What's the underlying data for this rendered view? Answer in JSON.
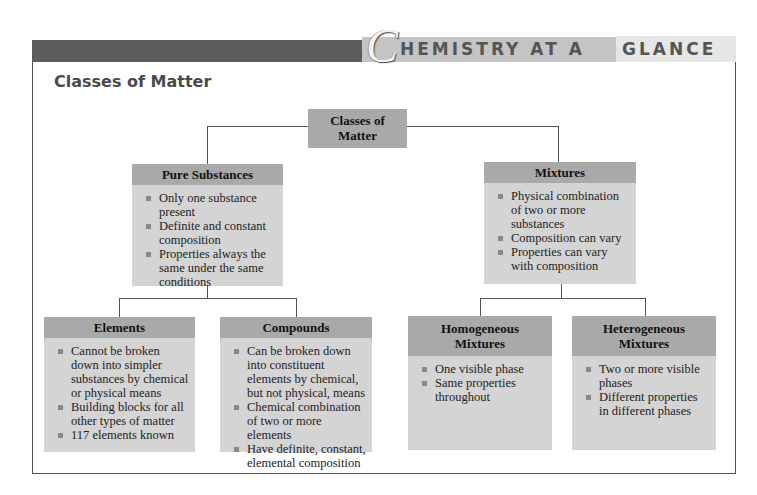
{
  "banner": {
    "initial": "C",
    "title_part1": "HEMISTRY AT A",
    "title_part2": "GLANCE"
  },
  "page_title": "Classes of Matter",
  "diagram": {
    "root": {
      "label": "Classes of Matter",
      "line1": "Classes of",
      "line2": "Matter"
    },
    "pure_substances": {
      "label": "Pure Substances",
      "bullets": [
        "Only one substance present",
        "Definite and constant composition",
        "Properties always the same under the same conditions"
      ]
    },
    "mixtures": {
      "label": "Mixtures",
      "bullets": [
        "Physical combination of two or more substances",
        "Composition can vary",
        "Properties can vary with composition"
      ]
    },
    "elements": {
      "label": "Elements",
      "bullets": [
        "Cannot be broken down into simpler substances by chemical or physical means",
        "Building blocks for all other types of matter",
        "117 elements known"
      ]
    },
    "compounds": {
      "label": "Compounds",
      "bullets": [
        "Can be broken down into constituent elements by chemical, but not physical, means",
        "Chemical combination of two or more elements",
        "Have definite, constant, elemental composition"
      ]
    },
    "homogeneous": {
      "label": "Homogeneous Mixtures",
      "bullets": [
        "One visible phase",
        "Same properties throughout"
      ]
    },
    "heterogeneous": {
      "label": "Heterogeneous Mixtures",
      "bullets": [
        "Two or more visible phases",
        "Different properties in different phases"
      ]
    }
  }
}
